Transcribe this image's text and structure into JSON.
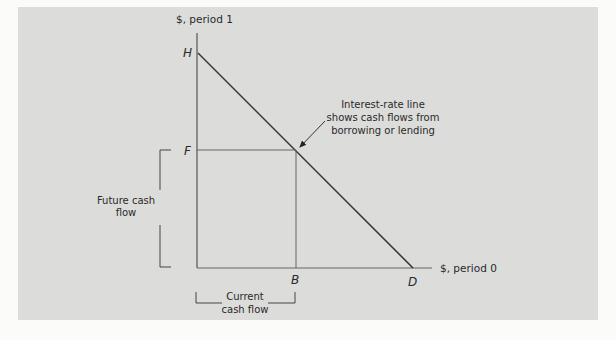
{
  "diagram": {
    "y_axis_label": "$, period 1",
    "x_axis_label": "$, period 0",
    "points": {
      "H": "H",
      "F": "F",
      "B": "B",
      "D": "D"
    },
    "annotation": {
      "line1": "Interest-rate line",
      "line2": "shows cash flows from",
      "line3": "borrowing or lending"
    },
    "future_bracket": {
      "line1": "Future cash",
      "line2": "flow"
    },
    "current_bracket": {
      "line1": "Current",
      "line2": "cash flow"
    },
    "colors": {
      "panel_bg": "#dcdcdb",
      "page_bg": "#fbfbfa",
      "axis": "#555555",
      "interest_line": "#333333",
      "guide_lines": "#666666",
      "text": "#2a2a2a"
    }
  }
}
